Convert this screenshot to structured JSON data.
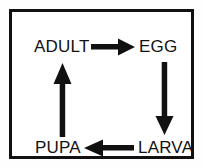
{
  "diagram": {
    "type": "cycle-diagram",
    "frame": {
      "border_color": "#111111",
      "border_width_px": 3,
      "background_color": "#ffffff"
    },
    "nodes": [
      {
        "id": "adult",
        "label": "ADULT",
        "position": "top-left"
      },
      {
        "id": "egg",
        "label": "EGG",
        "position": "top-right"
      },
      {
        "id": "larva",
        "label": "LARVA",
        "position": "bottom-right"
      },
      {
        "id": "pupa",
        "label": "PUPA",
        "position": "bottom-left"
      }
    ],
    "arrows": [
      {
        "id": "adult-to-egg",
        "from": "ADULT",
        "to": "EGG",
        "direction": "right",
        "color": "#111111"
      },
      {
        "id": "egg-to-larva",
        "from": "EGG",
        "to": "LARVA",
        "direction": "down",
        "color": "#111111"
      },
      {
        "id": "larva-to-pupa",
        "from": "LARVA",
        "to": "PUPA",
        "direction": "left",
        "color": "#111111"
      },
      {
        "id": "pupa-to-adult",
        "from": "PUPA",
        "to": "ADULT",
        "direction": "up",
        "color": "#111111"
      }
    ],
    "colors": {
      "ink": "#111111",
      "paper": "#ffffff"
    }
  }
}
